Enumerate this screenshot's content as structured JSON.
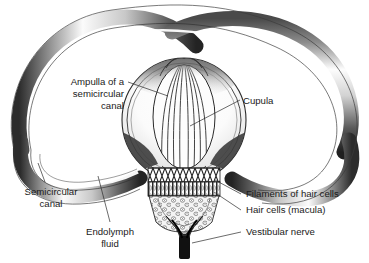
{
  "figure": {
    "background_color": "#ffffff",
    "ink_color": "#1a1a1a",
    "style": "grayscale anatomical line and tone illustration"
  },
  "labels": {
    "ampulla": {
      "name": "Ampulla of a semicircular canal",
      "lines": [
        "Ampulla of a",
        "semicircular",
        "canal"
      ],
      "align": "right",
      "x": 124,
      "y": 85
    },
    "cupula": {
      "name": "Cupula",
      "lines": [
        "Cupula"
      ],
      "align": "left",
      "x": 243,
      "y": 102
    },
    "semicircular_canal": {
      "name": "Semicircular canal",
      "lines": [
        "Semicircular",
        "canal"
      ],
      "align": "center",
      "x": 51,
      "y": 192
    },
    "endolymph": {
      "name": "Endolymph fluid",
      "lines": [
        "Endolymph",
        "fluid"
      ],
      "align": "center",
      "x": 110,
      "y": 232
    },
    "filaments": {
      "name": "Filaments of hair cells",
      "lines": [
        "Filaments of hair cells"
      ],
      "align": "left",
      "x": 244,
      "y": 197
    },
    "hair_cells": {
      "name": "Hair cells (macula)",
      "lines": [
        "Hair cells (macula)"
      ],
      "align": "left",
      "x": 244,
      "y": 213
    },
    "vestibular_nerve": {
      "name": "Vestibular nerve",
      "lines": [
        "Vestibular nerve"
      ],
      "align": "left",
      "x": 244,
      "y": 235
    }
  },
  "structures": [
    {
      "id": "semicircular-canal-tube",
      "label": "Semicircular canal tube"
    },
    {
      "id": "ampulla-chamber",
      "label": "Ampulla chamber"
    },
    {
      "id": "cupula-body",
      "label": "Cupula"
    },
    {
      "id": "filament-band",
      "label": "Filaments of hair cells"
    },
    {
      "id": "hair-cell-band",
      "label": "Hair cells"
    },
    {
      "id": "macula-tissue",
      "label": "Macula"
    },
    {
      "id": "vestibular-nerve-trunk",
      "label": "Vestibular nerve"
    },
    {
      "id": "endolymph-lumen",
      "label": "Endolymph fluid lumen"
    }
  ]
}
